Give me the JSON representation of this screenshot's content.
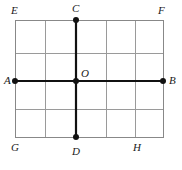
{
  "figure": {
    "width": 182,
    "height": 170,
    "background_color": "#ffffff",
    "rectangle": {
      "name": "EFHG",
      "left": 15,
      "right": 163,
      "top": 20,
      "bottom": 137,
      "border_color": "#888888",
      "border_width": 1
    },
    "grid": {
      "color": "#9a9a9a",
      "line_width": 1,
      "vertical_x": [
        45,
        76,
        106,
        135
      ],
      "horizontal_y": [
        53,
        81,
        109
      ],
      "columns": 5,
      "rows": 4
    },
    "segments": [
      {
        "name": "AB",
        "from": "A",
        "to": "B",
        "x1": 15,
        "y1": 81,
        "x2": 163,
        "y2": 81,
        "color": "#111111",
        "width": 2.2
      },
      {
        "name": "CD",
        "from": "C",
        "to": "D",
        "x1": 76,
        "y1": 20,
        "x2": 76,
        "y2": 137,
        "color": "#111111",
        "width": 2.2
      }
    ],
    "points": [
      {
        "id": "A",
        "label": "A",
        "x": 15,
        "y": 81,
        "dot": true,
        "label_x": 4,
        "label_y": 75,
        "dot_radius": 3.0
      },
      {
        "id": "B",
        "label": "B",
        "x": 163,
        "y": 81,
        "dot": true,
        "label_x": 169,
        "label_y": 75,
        "dot_radius": 3.0
      },
      {
        "id": "C",
        "label": "C",
        "x": 76,
        "y": 20,
        "dot": true,
        "label_x": 72,
        "label_y": 3,
        "dot_radius": 3.0
      },
      {
        "id": "D",
        "label": "D",
        "x": 76,
        "y": 137,
        "dot": true,
        "label_x": 72,
        "label_y": 146,
        "dot_radius": 3.0
      },
      {
        "id": "O",
        "label": "O",
        "x": 76,
        "y": 81,
        "dot": true,
        "label_x": 81,
        "label_y": 68,
        "dot_radius": 3.0
      }
    ],
    "corners": [
      {
        "id": "E",
        "label": "E",
        "x": 15,
        "y": 20,
        "dot": false,
        "label_x": 11,
        "label_y": 5
      },
      {
        "id": "F",
        "label": "F",
        "x": 163,
        "y": 20,
        "dot": false,
        "label_x": 158,
        "label_y": 5
      },
      {
        "id": "G",
        "label": "G",
        "x": 15,
        "y": 137,
        "dot": false,
        "label_x": 11,
        "label_y": 142
      },
      {
        "id": "H",
        "label": "H",
        "x": 135,
        "y": 137,
        "dot": false,
        "label_x": 133,
        "label_y": 142
      }
    ],
    "point_color": "#111111"
  }
}
